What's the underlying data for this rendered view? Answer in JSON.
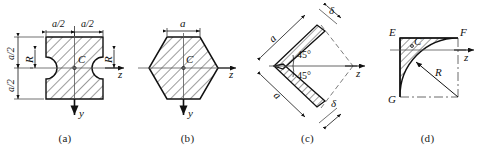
{
  "plate": {
    "title": "Cross-section figures (a)-(d)",
    "background": "#ffffff",
    "line_color": "#111111",
    "hatch_color": "#222222"
  },
  "figures": [
    {
      "id": "a",
      "caption": "(a)",
      "description": "square section with two semicircular notches",
      "labels": {
        "top_left_dim": "a/2",
        "top_right_dim": "a/2",
        "left_upper_dim": "a/2",
        "left_lower_dim": "a/2",
        "radius_left": "R",
        "radius_right": "R",
        "centroid": "C",
        "axis_z": "z",
        "axis_y": "y"
      }
    },
    {
      "id": "b",
      "caption": "(b)",
      "description": "regular hexagon section",
      "labels": {
        "top_dim": "a",
        "centroid": "C",
        "axis_z": "z",
        "axis_y": "y"
      }
    },
    {
      "id": "c",
      "caption": "(c)",
      "description": "thin V-shaped angle section at 45 degrees",
      "labels": {
        "upper_leg": "a",
        "lower_leg": "a",
        "upper_thickness": "δ",
        "lower_thickness": "δ",
        "angle_upper": "45°",
        "angle_lower": "45°",
        "axis_z": "z"
      }
    },
    {
      "id": "d",
      "caption": "(d)",
      "description": "quarter circle fillet area EFG with radius R",
      "labels": {
        "point_e": "E",
        "point_f": "F",
        "point_g": "G",
        "centroid": "C",
        "radius": "R",
        "axis_z": "z"
      }
    }
  ]
}
